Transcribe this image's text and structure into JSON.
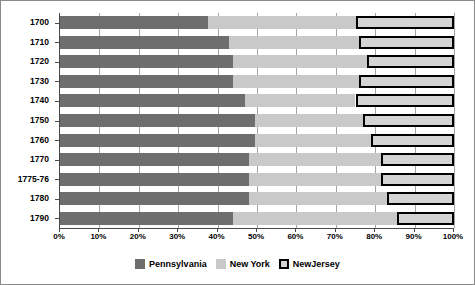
{
  "chart_data": {
    "type": "bar",
    "orientation": "horizontal",
    "stacked": true,
    "normalized_percent": true,
    "title": "",
    "subtitle": "",
    "xlabel": "",
    "ylabel": "",
    "xlim": [
      0,
      100
    ],
    "grid": true,
    "legend_position": "bottom-center",
    "categories": [
      "1700",
      "1710",
      "1720",
      "1730",
      "1740",
      "1750",
      "1760",
      "1770",
      "1775-76",
      "1780",
      "1790"
    ],
    "xtick_labels": [
      "0%",
      "10%",
      "20%",
      "30%",
      "40%",
      "50%",
      "60%",
      "70%",
      "80%",
      "90%",
      "100%"
    ],
    "xtick_values": [
      0,
      10,
      20,
      30,
      40,
      50,
      60,
      70,
      80,
      90,
      100
    ],
    "series": [
      {
        "name": "Pennsylvania",
        "color": "#6e6e6e",
        "values": [
          37.5,
          43.0,
          44.0,
          44.0,
          47.0,
          49.5,
          49.5,
          48.0,
          48.0,
          48.0,
          44.0
        ]
      },
      {
        "name": "New York",
        "color": "#c9c9c9",
        "values": [
          37.5,
          33.0,
          34.0,
          32.0,
          28.0,
          27.5,
          29.5,
          33.5,
          33.5,
          35.0,
          41.5
        ]
      },
      {
        "name": "NewJersey",
        "color": "#d4d4d4",
        "values": [
          25.0,
          24.0,
          22.0,
          24.0,
          25.0,
          23.0,
          21.0,
          18.5,
          18.5,
          17.0,
          14.5
        ]
      }
    ]
  },
  "legend": {
    "items": [
      {
        "label": "Pennsylvania",
        "swatch": "pennsylvania-swatch"
      },
      {
        "label": "New York",
        "swatch": "new-york-swatch"
      },
      {
        "label": "NewJersey",
        "swatch": "newjersey-swatch"
      }
    ]
  },
  "colors": {
    "pennsylvania": "#6e6e6e",
    "new_york": "#c9c9c9",
    "newjersey_fill": "#d4d4d4",
    "newjersey_outline": "#000000",
    "axis": "#4a4a4a",
    "frame": "#8a8a8a",
    "background": "#ffffff"
  }
}
